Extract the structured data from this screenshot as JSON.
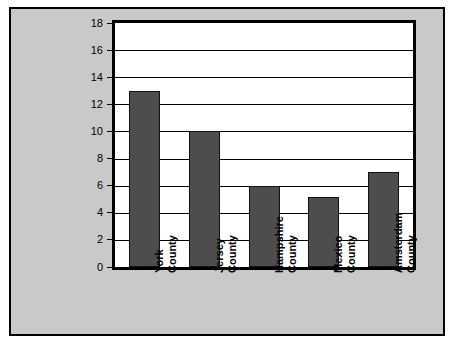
{
  "chart_data": {
    "type": "bar",
    "title": "",
    "xlabel": "",
    "ylabel": "Number of Brokers",
    "ylim": [
      0,
      18
    ],
    "ytick_step": 2,
    "yticks": [
      0,
      2,
      4,
      6,
      8,
      10,
      12,
      14,
      16,
      18
    ],
    "grid": true,
    "legend": "none",
    "categories": [
      "York County",
      "Jersey County",
      "Hampshire County",
      "Mexico County",
      "Amsterdam County"
    ],
    "category_lines": [
      [
        "York",
        "County"
      ],
      [
        "Jersey",
        "County"
      ],
      [
        "Hampshire",
        "County"
      ],
      [
        "Mexico",
        "County"
      ],
      [
        "Amsterdam",
        "County"
      ]
    ],
    "values": [
      13,
      10,
      6,
      5.2,
      7
    ],
    "colors": {
      "bar_fill": "#4d4d4d",
      "bar_edge": "#111111",
      "plot_background": "#ffffff",
      "figure_background": "#c9c9c9",
      "frame": "#000000",
      "gridline": "#000000",
      "text": "#000000"
    }
  }
}
